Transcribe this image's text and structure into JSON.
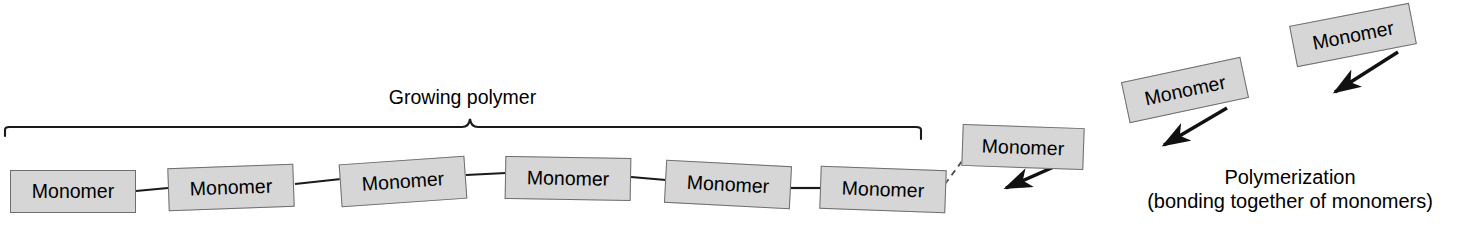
{
  "diagram": {
    "background_color": "#ffffff",
    "box_fill_color": "#d6d6d6",
    "box_border_color": "#6e6e6e",
    "line_color": "#1a1a1a",
    "text_color": "#000000",
    "brace_label": "Growing polymer",
    "caption": {
      "line1": "Polymerization",
      "line2": "(bonding together of monomers)"
    },
    "chain_monomers": [
      {
        "label": "Monomer",
        "x": 10,
        "y": 170,
        "rotation": 0
      },
      {
        "label": "Monomer",
        "x": 168,
        "y": 166,
        "rotation": -2
      },
      {
        "label": "Monomer",
        "x": 340,
        "y": 160,
        "rotation": -4
      },
      {
        "label": "Monomer",
        "x": 505,
        "y": 157,
        "rotation": 1
      },
      {
        "label": "Monomer",
        "x": 665,
        "y": 163,
        "rotation": 3
      },
      {
        "label": "Monomer",
        "x": 820,
        "y": 168,
        "rotation": 2
      }
    ],
    "free_monomers": [
      {
        "label": "Monomer",
        "x": 962,
        "y": 126,
        "rotation": 2
      },
      {
        "label": "Monomer",
        "x": 1124,
        "y": 69,
        "rotation": -12
      },
      {
        "label": "Monomer",
        "x": 1292,
        "y": 14,
        "rotation": -11
      }
    ],
    "connectors": [
      {
        "type": "solid",
        "from": [
          136,
          191
        ],
        "to": [
          168,
          188
        ]
      },
      {
        "type": "solid",
        "from": [
          295,
          184
        ],
        "to": [
          341,
          179
        ]
      },
      {
        "type": "solid",
        "from": [
          466,
          175
        ],
        "to": [
          506,
          173
        ]
      },
      {
        "type": "solid",
        "from": [
          631,
          177
        ],
        "to": [
          666,
          180
        ]
      },
      {
        "type": "solid",
        "from": [
          790,
          188
        ],
        "to": [
          822,
          188
        ]
      },
      {
        "type": "dashed",
        "from": [
          945,
          184
        ],
        "to": [
          977,
          141
        ]
      }
    ],
    "arrows": [
      {
        "from": [
          1065,
          162
        ],
        "to": [
          1000,
          191
        ]
      },
      {
        "from": [
          1227,
          108
        ],
        "to": [
          1158,
          148
        ]
      },
      {
        "from": [
          1398,
          52
        ],
        "to": [
          1329,
          95
        ]
      }
    ],
    "brace": {
      "left_x": 5,
      "right_x": 921,
      "y": 127,
      "peak_x": 470,
      "peak_y": 118
    }
  }
}
